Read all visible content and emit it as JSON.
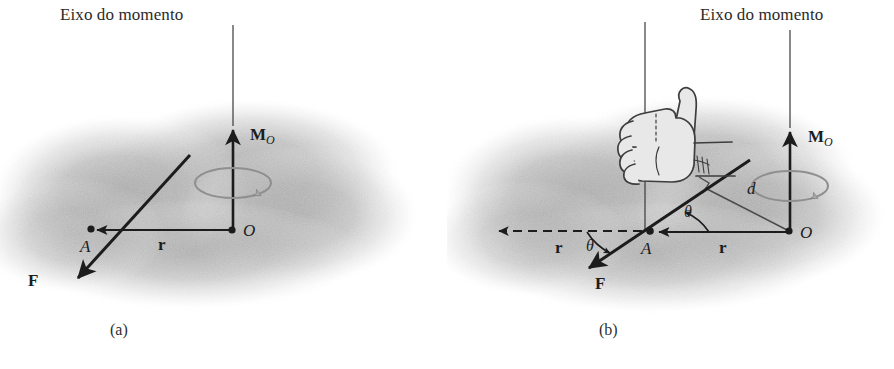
{
  "figure": {
    "title": "Eixo do momento",
    "width": 894,
    "height": 369,
    "background_color": "#ffffff",
    "ink_color": "#1c1c1c",
    "shade_color": "#b4b4b4",
    "rotation_arrow_color": "#8a8a8a"
  },
  "panels": [
    {
      "id": "a",
      "caption": "(a)",
      "axis_label": "Eixo do momento",
      "labels": {
        "moment": "M",
        "moment_subscript": "O",
        "force": "F",
        "position": "r",
        "point_a": "A",
        "point_o": "O"
      }
    },
    {
      "id": "b",
      "caption": "(b)",
      "axis_label": "Eixo do momento",
      "labels": {
        "moment": "M",
        "moment_subscript": "O",
        "force": "F",
        "position": "r",
        "position_dashed": "r",
        "point_a": "A",
        "point_o": "O",
        "distance": "d",
        "angle_upper": "θ",
        "angle_lower": "θ"
      },
      "icons": {
        "hand": "right-hand-thumbs-up-icon"
      }
    }
  ]
}
